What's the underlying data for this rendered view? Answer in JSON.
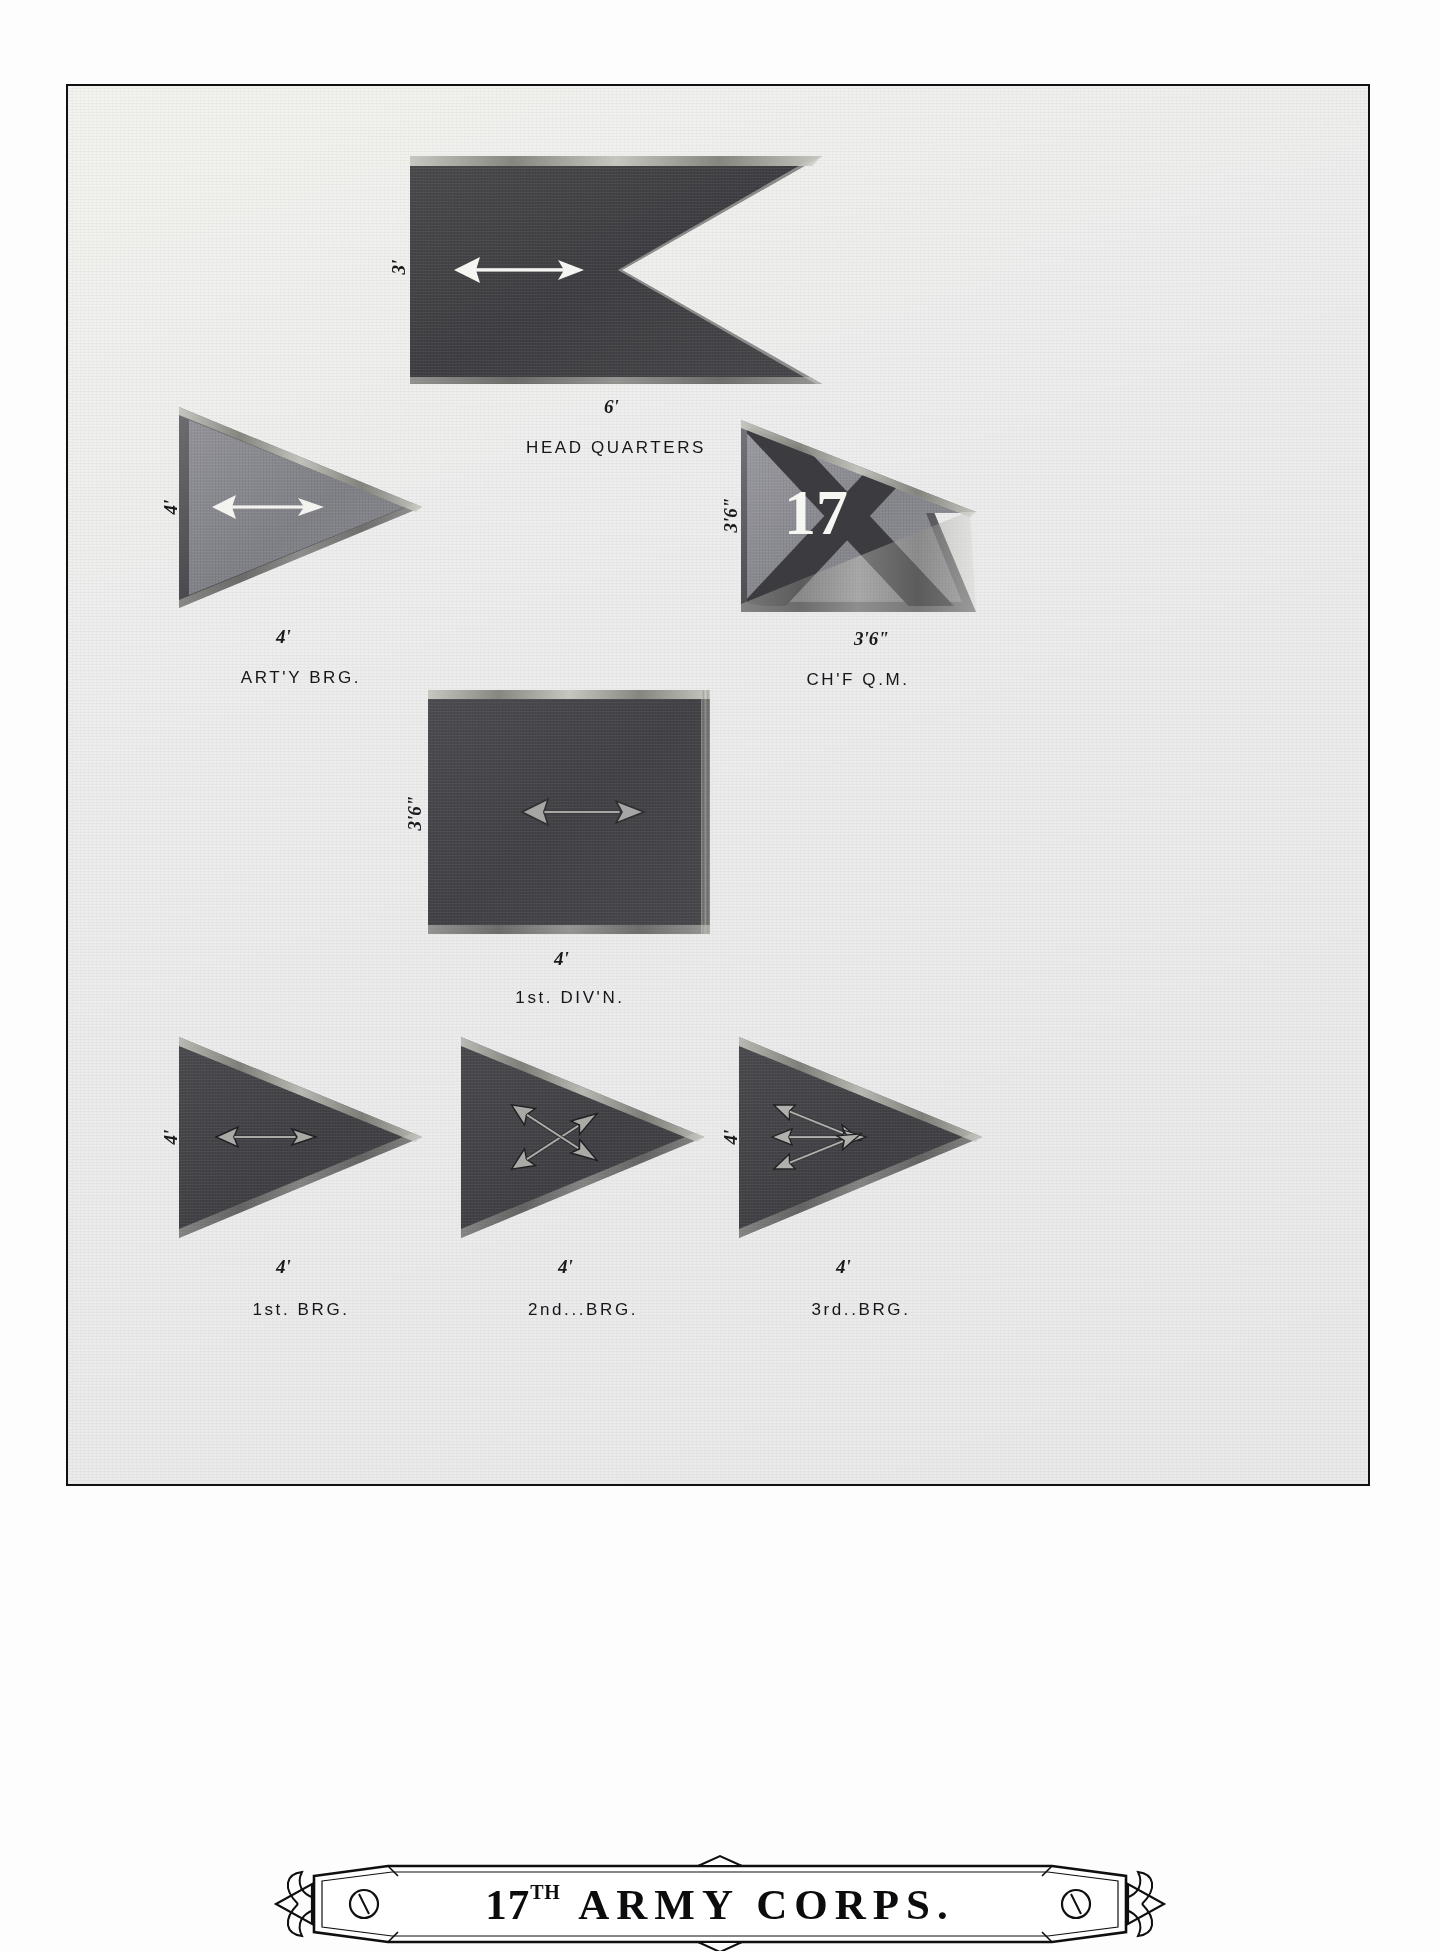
{
  "plate": {
    "title_main": "17",
    "title_sup": "TH",
    "title_rest": "ARMY CORPS.",
    "border_color": "#111111",
    "paper_color": "#ececed"
  },
  "colors": {
    "flag_dark": "#424246",
    "flag_mid": "#83838a",
    "arrow_light": "#f4f4f0",
    "arrow_gray": "#9d9d9d",
    "numeral_white": "#f6f6f2",
    "ink": "#16161a"
  },
  "figures": [
    {
      "id": "head-quarters",
      "caption": "HEAD QUARTERS",
      "shape": "swallowtail",
      "field": "dark",
      "device": "arrow-light",
      "dim_hoist": "3'",
      "dim_fly": "6'"
    },
    {
      "id": "artillery-brigade",
      "caption": "ART'Y BRG.",
      "shape": "triangle",
      "field": "mid",
      "device": "arrow-light",
      "dim_hoist": "4'",
      "dim_fly": "4'"
    },
    {
      "id": "chief-quartermaster",
      "caption": "CH'F Q.M.",
      "shape": "swallowtail",
      "field": "mid",
      "device": "saltire-numeral",
      "numeral": "17",
      "dim_hoist": "3'6\"",
      "dim_fly": "3'6\""
    },
    {
      "id": "first-division",
      "caption": "1st. DIV'N.",
      "shape": "rectangle",
      "field": "dark",
      "device": "arrow-gray",
      "dim_hoist": "3'6\"",
      "dim_fly": "4'"
    },
    {
      "id": "first-brigade",
      "caption": "1st. BRG.",
      "shape": "triangle",
      "field": "dark",
      "device": "arrow-gray",
      "dim_hoist": "4'",
      "dim_fly": "4'"
    },
    {
      "id": "second-brigade",
      "caption": "2nd...BRG.",
      "shape": "triangle",
      "field": "dark",
      "device": "two-crossed-arrows",
      "dim_hoist": "",
      "dim_fly": "4'"
    },
    {
      "id": "third-brigade",
      "caption": "3rd..BRG.",
      "shape": "triangle",
      "field": "dark",
      "device": "three-converging-arrows",
      "dim_hoist": "4'",
      "dim_fly": "4'"
    }
  ]
}
